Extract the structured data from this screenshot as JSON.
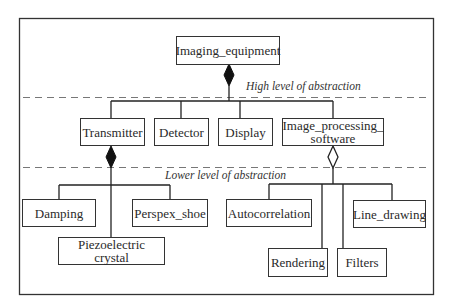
{
  "diagram": {
    "type": "uml-class-hierarchy",
    "levels": {
      "high": "High level of abstraction",
      "low": "Lower level of abstraction"
    },
    "root": "Imaging_equipment",
    "level1": [
      "Transmitter",
      "Detector",
      "Display",
      "Image_processing_ software"
    ],
    "transmitter_parts": [
      "Damping",
      "Perspex_shoe",
      "Piezoelectric crystal"
    ],
    "software_parts": [
      "Autocorrelation",
      "Rendering",
      "Filters",
      "Line_drawing"
    ],
    "relations": [
      {
        "from": "Imaging_equipment",
        "kind": "composition",
        "to": [
          "Transmitter",
          "Detector",
          "Display",
          "Image_processing_ software"
        ]
      },
      {
        "from": "Transmitter",
        "kind": "composition",
        "to": [
          "Damping",
          "Perspex_shoe",
          "Piezoelectric crystal"
        ]
      },
      {
        "from": "Image_processing_ software",
        "kind": "aggregation",
        "to": [
          "Autocorrelation",
          "Rendering",
          "Filters",
          "Line_drawing"
        ]
      }
    ]
  }
}
